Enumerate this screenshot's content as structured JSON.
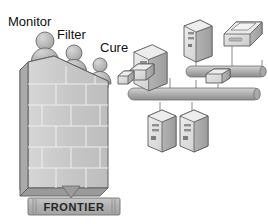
{
  "diagram": {
    "background_color": "#ffffff",
    "labels": {
      "monitor": "Monitor",
      "filter": "Filter",
      "cure": "Cure"
    },
    "banner": {
      "text": "FRONTIER",
      "fill_color": "#b4b4b4",
      "text_color": "#262626"
    },
    "wall": {
      "name": "brick-wall",
      "face_color": "#c8c8c8",
      "side_color": "#a0a0a0",
      "top_color": "#dcdcdc",
      "mortar_color": "#e8e8e8",
      "brick_rows": 6
    },
    "guards": [
      {
        "name": "guard-monitor",
        "label": "Monitor"
      },
      {
        "name": "guard-filter",
        "label": "Filter"
      },
      {
        "name": "guard-cure",
        "label": "Cure"
      }
    ],
    "network": {
      "bus_color": "#b0b0b0",
      "line_color": "#8a8a8a",
      "buses": [
        {
          "name": "upper-bus"
        },
        {
          "name": "main-bus"
        }
      ],
      "devices": [
        {
          "name": "server-top",
          "type": "server"
        },
        {
          "name": "server-left",
          "type": "server"
        },
        {
          "name": "server-lower-left",
          "type": "server"
        },
        {
          "name": "server-lower-right",
          "type": "server"
        },
        {
          "name": "printer",
          "type": "printer"
        },
        {
          "name": "modem-left",
          "type": "modem"
        },
        {
          "name": "modem-center",
          "type": "modem"
        },
        {
          "name": "modem-edge",
          "type": "modem"
        }
      ]
    },
    "colors": {
      "ink": "#111111",
      "outline": "#555555",
      "device_light": "#e4e4e4",
      "device_mid": "#c6c6c6",
      "device_dark": "#9a9a9a"
    }
  }
}
